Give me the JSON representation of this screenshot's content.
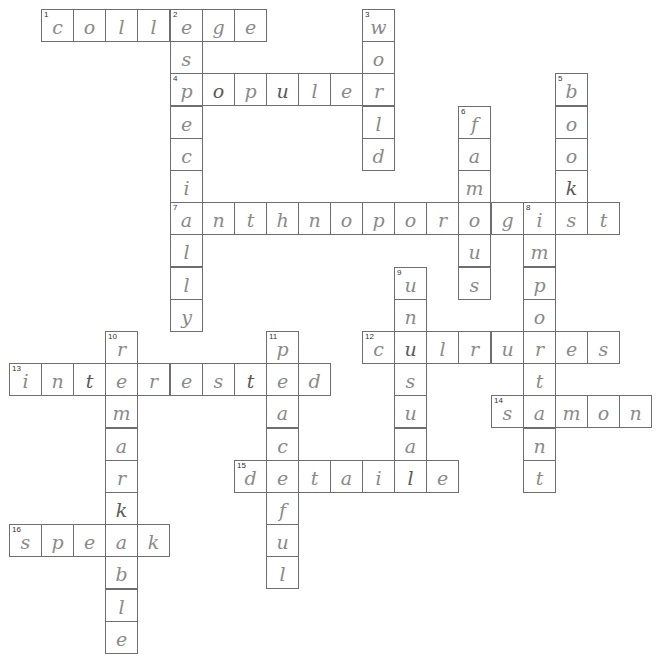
{
  "puzzle": {
    "grid": {
      "origin_x": 9,
      "origin_y": 9,
      "cell_w": 32.1,
      "cell_h": 32.2
    },
    "colors": {
      "border": "#6e6e6e",
      "ink": "#8a8a8a",
      "background": "#ffffff"
    },
    "entries": [
      {
        "number": "1",
        "direction": "across",
        "row": 0,
        "col": 1,
        "answer": "college"
      },
      {
        "number": "2",
        "direction": "down",
        "row": 0,
        "col": 5,
        "answer": "especially"
      },
      {
        "number": "3",
        "direction": "down",
        "row": 0,
        "col": 11,
        "answer": "world"
      },
      {
        "number": "4",
        "direction": "across",
        "row": 2,
        "col": 5,
        "answer": "populer"
      },
      {
        "number": "5",
        "direction": "down",
        "row": 2,
        "col": 17,
        "answer": "book"
      },
      {
        "number": "6",
        "direction": "down",
        "row": 3,
        "col": 14,
        "answer": "famous"
      },
      {
        "number": "7",
        "direction": "across",
        "row": 6,
        "col": 5,
        "answer": "anthnoporogist"
      },
      {
        "number": "8",
        "direction": "down",
        "row": 6,
        "col": 16,
        "answer": "important"
      },
      {
        "number": "9",
        "direction": "down",
        "row": 8,
        "col": 12,
        "answer": "unusual"
      },
      {
        "number": "10",
        "direction": "down",
        "row": 10,
        "col": 3,
        "answer": "remarkable"
      },
      {
        "number": "11",
        "direction": "down",
        "row": 10,
        "col": 8,
        "answer": "peaceful"
      },
      {
        "number": "12",
        "direction": "across",
        "row": 10,
        "col": 11,
        "answer": "culrures"
      },
      {
        "number": "13",
        "direction": "across",
        "row": 11,
        "col": 0,
        "answer": "interested"
      },
      {
        "number": "14",
        "direction": "across",
        "row": 12,
        "col": 15,
        "answer": "samon"
      },
      {
        "number": "15",
        "direction": "across",
        "row": 14,
        "col": 7,
        "answer": "detaile"
      },
      {
        "number": "16",
        "direction": "across",
        "row": 16,
        "col": 0,
        "answer": "speak"
      }
    ],
    "cells": [
      {
        "r": 0,
        "c": 1,
        "ch": "c",
        "n": "1"
      },
      {
        "r": 0,
        "c": 2,
        "ch": "o"
      },
      {
        "r": 0,
        "c": 3,
        "ch": "l"
      },
      {
        "r": 0,
        "c": 4,
        "ch": "l"
      },
      {
        "r": 0,
        "c": 5,
        "ch": "e",
        "n": "2"
      },
      {
        "r": 0,
        "c": 6,
        "ch": "g"
      },
      {
        "r": 0,
        "c": 7,
        "ch": "e"
      },
      {
        "r": 0,
        "c": 11,
        "ch": "w",
        "n": "3"
      },
      {
        "r": 1,
        "c": 5,
        "ch": "s"
      },
      {
        "r": 1,
        "c": 11,
        "ch": "o"
      },
      {
        "r": 2,
        "c": 5,
        "ch": "p",
        "n": "4"
      },
      {
        "r": 2,
        "c": 6,
        "ch": "o",
        "dark": true
      },
      {
        "r": 2,
        "c": 7,
        "ch": "p"
      },
      {
        "r": 2,
        "c": 8,
        "ch": "u",
        "dark": true
      },
      {
        "r": 2,
        "c": 9,
        "ch": "l"
      },
      {
        "r": 2,
        "c": 10,
        "ch": "e"
      },
      {
        "r": 2,
        "c": 11,
        "ch": "r"
      },
      {
        "r": 2,
        "c": 17,
        "ch": "b",
        "n": "5"
      },
      {
        "r": 3,
        "c": 5,
        "ch": "e"
      },
      {
        "r": 3,
        "c": 11,
        "ch": "l"
      },
      {
        "r": 3,
        "c": 14,
        "ch": "f",
        "n": "6"
      },
      {
        "r": 3,
        "c": 17,
        "ch": "o"
      },
      {
        "r": 4,
        "c": 5,
        "ch": "c"
      },
      {
        "r": 4,
        "c": 11,
        "ch": "d"
      },
      {
        "r": 4,
        "c": 14,
        "ch": "a"
      },
      {
        "r": 4,
        "c": 17,
        "ch": "o"
      },
      {
        "r": 5,
        "c": 5,
        "ch": "i"
      },
      {
        "r": 5,
        "c": 14,
        "ch": "m"
      },
      {
        "r": 5,
        "c": 17,
        "ch": "k",
        "dark": true
      },
      {
        "r": 6,
        "c": 5,
        "ch": "a",
        "n": "7"
      },
      {
        "r": 6,
        "c": 6,
        "ch": "n"
      },
      {
        "r": 6,
        "c": 7,
        "ch": "t"
      },
      {
        "r": 6,
        "c": 8,
        "ch": "h"
      },
      {
        "r": 6,
        "c": 9,
        "ch": "n"
      },
      {
        "r": 6,
        "c": 10,
        "ch": "o"
      },
      {
        "r": 6,
        "c": 11,
        "ch": "p"
      },
      {
        "r": 6,
        "c": 12,
        "ch": "o"
      },
      {
        "r": 6,
        "c": 13,
        "ch": "r"
      },
      {
        "r": 6,
        "c": 14,
        "ch": "o"
      },
      {
        "r": 6,
        "c": 15,
        "ch": "g"
      },
      {
        "r": 6,
        "c": 16,
        "ch": "i",
        "n": "8"
      },
      {
        "r": 6,
        "c": 17,
        "ch": "s"
      },
      {
        "r": 6,
        "c": 18,
        "ch": "t"
      },
      {
        "r": 7,
        "c": 5,
        "ch": "l"
      },
      {
        "r": 7,
        "c": 14,
        "ch": "u"
      },
      {
        "r": 7,
        "c": 16,
        "ch": "m"
      },
      {
        "r": 8,
        "c": 5,
        "ch": "l"
      },
      {
        "r": 8,
        "c": 12,
        "ch": "u",
        "n": "9"
      },
      {
        "r": 8,
        "c": 14,
        "ch": "s"
      },
      {
        "r": 8,
        "c": 16,
        "ch": "p"
      },
      {
        "r": 9,
        "c": 5,
        "ch": "y"
      },
      {
        "r": 9,
        "c": 12,
        "ch": "n"
      },
      {
        "r": 9,
        "c": 16,
        "ch": "o"
      },
      {
        "r": 10,
        "c": 3,
        "ch": "r",
        "n": "10"
      },
      {
        "r": 10,
        "c": 8,
        "ch": "p",
        "n": "11"
      },
      {
        "r": 10,
        "c": 11,
        "ch": "c",
        "n": "12"
      },
      {
        "r": 10,
        "c": 12,
        "ch": "u",
        "dark": true
      },
      {
        "r": 10,
        "c": 13,
        "ch": "l"
      },
      {
        "r": 10,
        "c": 14,
        "ch": "r"
      },
      {
        "r": 10,
        "c": 15,
        "ch": "u"
      },
      {
        "r": 10,
        "c": 16,
        "ch": "r"
      },
      {
        "r": 10,
        "c": 17,
        "ch": "e"
      },
      {
        "r": 10,
        "c": 18,
        "ch": "s"
      },
      {
        "r": 11,
        "c": 0,
        "ch": "i",
        "n": "13"
      },
      {
        "r": 11,
        "c": 1,
        "ch": "n"
      },
      {
        "r": 11,
        "c": 2,
        "ch": "t",
        "dark": true
      },
      {
        "r": 11,
        "c": 3,
        "ch": "e"
      },
      {
        "r": 11,
        "c": 4,
        "ch": "r"
      },
      {
        "r": 11,
        "c": 5,
        "ch": "e"
      },
      {
        "r": 11,
        "c": 6,
        "ch": "s"
      },
      {
        "r": 11,
        "c": 7,
        "ch": "t",
        "dark": true
      },
      {
        "r": 11,
        "c": 8,
        "ch": "e"
      },
      {
        "r": 11,
        "c": 9,
        "ch": "d"
      },
      {
        "r": 11,
        "c": 12,
        "ch": "s"
      },
      {
        "r": 11,
        "c": 16,
        "ch": "t"
      },
      {
        "r": 12,
        "c": 3,
        "ch": "m"
      },
      {
        "r": 12,
        "c": 8,
        "ch": "a"
      },
      {
        "r": 12,
        "c": 12,
        "ch": "u"
      },
      {
        "r": 12,
        "c": 15,
        "ch": "s",
        "n": "14"
      },
      {
        "r": 12,
        "c": 16,
        "ch": "a"
      },
      {
        "r": 12,
        "c": 17,
        "ch": "m"
      },
      {
        "r": 12,
        "c": 18,
        "ch": "o"
      },
      {
        "r": 12,
        "c": 19,
        "ch": "n"
      },
      {
        "r": 13,
        "c": 3,
        "ch": "a"
      },
      {
        "r": 13,
        "c": 8,
        "ch": "c"
      },
      {
        "r": 13,
        "c": 12,
        "ch": "a"
      },
      {
        "r": 13,
        "c": 16,
        "ch": "n"
      },
      {
        "r": 14,
        "c": 3,
        "ch": "r"
      },
      {
        "r": 14,
        "c": 7,
        "ch": "d",
        "n": "15"
      },
      {
        "r": 14,
        "c": 8,
        "ch": "e"
      },
      {
        "r": 14,
        "c": 9,
        "ch": "t"
      },
      {
        "r": 14,
        "c": 10,
        "ch": "a"
      },
      {
        "r": 14,
        "c": 11,
        "ch": "i"
      },
      {
        "r": 14,
        "c": 12,
        "ch": "l",
        "dark": true
      },
      {
        "r": 14,
        "c": 13,
        "ch": "e"
      },
      {
        "r": 14,
        "c": 16,
        "ch": "t"
      },
      {
        "r": 15,
        "c": 3,
        "ch": "k",
        "dark": true
      },
      {
        "r": 15,
        "c": 8,
        "ch": "f"
      },
      {
        "r": 16,
        "c": 0,
        "ch": "s",
        "n": "16"
      },
      {
        "r": 16,
        "c": 1,
        "ch": "p"
      },
      {
        "r": 16,
        "c": 2,
        "ch": "e"
      },
      {
        "r": 16,
        "c": 3,
        "ch": "a"
      },
      {
        "r": 16,
        "c": 4,
        "ch": "k"
      },
      {
        "r": 16,
        "c": 8,
        "ch": "u"
      },
      {
        "r": 17,
        "c": 3,
        "ch": "b"
      },
      {
        "r": 17,
        "c": 8,
        "ch": "l"
      },
      {
        "r": 18,
        "c": 3,
        "ch": "l"
      },
      {
        "r": 19,
        "c": 3,
        "ch": "e"
      }
    ]
  }
}
